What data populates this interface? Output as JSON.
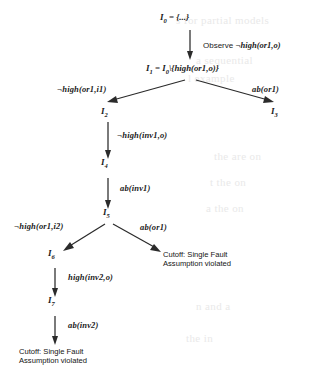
{
  "figure": {
    "type": "search-tree"
  },
  "nodes": [
    {
      "id": "I0",
      "label": "I",
      "sub": "0",
      "text": "I0 = {...}",
      "equation": " = {...}"
    },
    {
      "id": "I1",
      "label": "I",
      "sub": "1",
      "equation": " = I0\\{high(or1,o)}"
    },
    {
      "id": "I2",
      "label": "I",
      "sub": "2"
    },
    {
      "id": "I3",
      "label": "I",
      "sub": "3"
    },
    {
      "id": "I4",
      "label": "I",
      "sub": "4"
    },
    {
      "id": "I5",
      "label": "I",
      "sub": "5"
    },
    {
      "id": "I6",
      "label": "I",
      "sub": "6"
    },
    {
      "id": "I7",
      "label": "I",
      "sub": "7"
    }
  ],
  "node_text": {
    "I0_base": "I",
    "I0_sub": "0",
    "I0_eq": "= {...}",
    "I1_base": "I",
    "I1_sub": "1",
    "I1_eq_lead": "= I",
    "I1_eq_sub": "0",
    "I1_eq_tail": "\\{high(or1,o)}",
    "I2_base": "I",
    "I2_sub": "2",
    "I3_base": "I",
    "I3_sub": "3",
    "I4_base": "I",
    "I4_sub": "4",
    "I5_base": "I",
    "I5_sub": "5",
    "I6_base": "I",
    "I6_sub": "6",
    "I7_base": "I",
    "I7_sub": "7"
  },
  "edges": [
    {
      "from": "I0",
      "to": "I1",
      "label_word": "Observe",
      "label_formula": "¬high(or1,o)"
    },
    {
      "from": "I1",
      "to": "I2",
      "label_formula": "¬high(or1,i1)"
    },
    {
      "from": "I1",
      "to": "I3",
      "label_formula": "ab(or1)"
    },
    {
      "from": "I2",
      "to": "I4",
      "label_formula": "¬high(inv1,o)"
    },
    {
      "from": "I4",
      "to": "I5",
      "label_formula": "ab(inv1)"
    },
    {
      "from": "I5",
      "to": "I6",
      "label_formula": "¬high(or1,i2)"
    },
    {
      "from": "I5",
      "to": "cutoff1",
      "label_formula": "ab(or1)"
    },
    {
      "from": "I6",
      "to": "I7",
      "label_formula": "high(inv2,o)"
    },
    {
      "from": "I7",
      "to": "cutoff2",
      "label_formula": "ab(inv2)"
    }
  ],
  "edge_labels": {
    "observe_word": "Observe",
    "observe_formula": "¬high(or1,o)",
    "e_or1_i1": "¬high(or1,i1)",
    "e_ab_or1_top": "ab(or1)",
    "e_inv1_o": "¬high(inv1,o)",
    "e_ab_inv1": "ab(inv1)",
    "e_or1_i2": "¬high(or1,i2)",
    "e_ab_or1_bottom": "ab(or1)",
    "e_inv2_o": "high(inv2,o)",
    "e_ab_inv2": "ab(inv2)"
  },
  "terminals": [
    {
      "id": "cutoff1",
      "line1": "Cutoff: Single Fault",
      "line2": "Assumption violated"
    },
    {
      "id": "cutoff2",
      "line1": "Cutoff: Single Fault",
      "line2": "Assumption violated"
    }
  ],
  "colors": {
    "ink": "#2b2b2b",
    "text": "#1a1a1a",
    "background": "#ffffff",
    "bleed_through": "#e9e9e9"
  },
  "bleed_through_text": [
    "s for partial models",
    "a sequential",
    "l example",
    "the are on",
    "t the on",
    "a the on",
    "n and a",
    "the in"
  ]
}
